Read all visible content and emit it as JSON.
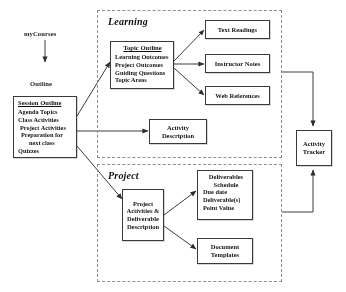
{
  "diagram": {
    "type": "flowchart",
    "entry": {
      "source_label": "myCourses",
      "outline_label": "Outline"
    },
    "session_outline": {
      "title": "Session Outline",
      "items": [
        "Agenda Topics",
        "Class Activities",
        "Project Activities",
        "Preparation for",
        "next class",
        "Quizzes"
      ]
    },
    "groups": [
      {
        "name": "learning",
        "title": "Learning"
      },
      {
        "name": "project",
        "title": "Project"
      }
    ],
    "topic_outline": {
      "title": "Topic Outline",
      "items": [
        "Learning Outcomes",
        "Project Outcomes",
        "Guiding Questions",
        "Topic Areas"
      ]
    },
    "resources": [
      {
        "name": "text-readings",
        "label": "Text Readings"
      },
      {
        "name": "instructor-notes",
        "label": "Instructor Notes"
      },
      {
        "name": "web-references",
        "label": "Web References"
      }
    ],
    "activity_description": {
      "line1": "Activity",
      "line2": "Description"
    },
    "project_activities": {
      "line1": "Project",
      "line2": "Activities &",
      "line3": "Deliverable",
      "line4": "Description"
    },
    "deliverables_schedule": {
      "title_line1": "Deliverables",
      "title_line2": "Schedule",
      "items": [
        "Due date",
        "Deliverable(s)",
        "Point Value"
      ]
    },
    "document_templates": {
      "line1": "Document",
      "line2": "Templates"
    },
    "activity_tracker": {
      "line1": "Activity",
      "line2": "Tracker"
    }
  }
}
